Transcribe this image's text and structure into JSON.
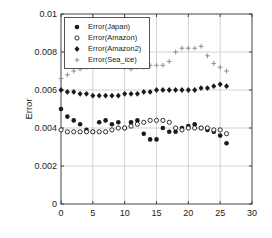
{
  "chart_data": {
    "type": "scatter",
    "title": "",
    "xlabel": "",
    "ylabel": "Error",
    "xlim": [
      0,
      30
    ],
    "ylim": [
      0,
      0.01
    ],
    "grid": true,
    "legend_position": "upper-left",
    "x_ticks": [
      0,
      5,
      10,
      15,
      20,
      25,
      30
    ],
    "x_tick_labels": [
      "0",
      "5",
      "10",
      "15",
      "20",
      "25",
      "30"
    ],
    "y_ticks": [
      0,
      0.002,
      0.004,
      0.006,
      0.008,
      0.01
    ],
    "y_tick_labels": [
      "0",
      "0.002",
      "0.004",
      "0.006",
      "0.008",
      "0.01"
    ],
    "colors": {
      "marker_black": "#1a1a1a",
      "marker_gray": "#8f8f8f",
      "grid": "#d2d2d2",
      "axis": "#444444",
      "text": "#222222"
    },
    "x": [
      0,
      1,
      2,
      3,
      4,
      5,
      6,
      7,
      8,
      9,
      10,
      11,
      12,
      13,
      14,
      15,
      16,
      17,
      18,
      19,
      20,
      21,
      22,
      23,
      24,
      25,
      26
    ],
    "series": [
      {
        "name": "Error(Japan)",
        "marker": "filled-circle",
        "color": "#1a1a1a",
        "values": [
          0.005,
          0.0046,
          0.0044,
          0.0042,
          0.0039,
          0.0038,
          0.0043,
          0.0044,
          0.0042,
          0.0043,
          0.004,
          0.0043,
          0.0044,
          0.0037,
          0.0034,
          0.0034,
          0.004,
          0.0038,
          0.0038,
          0.004,
          0.0041,
          0.0042,
          0.004,
          0.0039,
          0.0038,
          0.0036,
          0.0032
        ]
      },
      {
        "name": "Error(Amazon)",
        "marker": "open-circle",
        "color": "#1a1a1a",
        "values": [
          0.0039,
          0.0038,
          0.0038,
          0.0038,
          0.0038,
          0.0038,
          0.0038,
          0.0038,
          0.0039,
          0.004,
          0.004,
          0.0041,
          0.0042,
          0.0043,
          0.0044,
          0.0044,
          0.0044,
          0.0043,
          0.004,
          0.0039,
          0.004,
          0.004,
          0.004,
          0.004,
          0.0039,
          0.0039,
          0.0037
        ]
      },
      {
        "name": "Error(Amazon2)",
        "marker": "filled-diamond",
        "color": "#1a1a1a",
        "values": [
          0.006,
          0.0059,
          0.0059,
          0.0058,
          0.0058,
          0.0057,
          0.0057,
          0.0057,
          0.0057,
          0.0057,
          0.0058,
          0.0058,
          0.0058,
          0.0059,
          0.0059,
          0.006,
          0.006,
          0.006,
          0.006,
          0.006,
          0.006,
          0.006,
          0.0061,
          0.0061,
          0.0062,
          0.0063,
          0.0062
        ]
      },
      {
        "name": "Error(Sea_ice)",
        "marker": "plus",
        "color": "#8f8f8f",
        "values": [
          0.0066,
          0.0068,
          0.007,
          0.0071,
          0.0072,
          0.0073,
          0.0074,
          0.0074,
          0.0074,
          0.0073,
          0.0072,
          0.0071,
          0.0072,
          0.0072,
          0.0073,
          0.0073,
          0.0073,
          0.0075,
          0.008,
          0.0082,
          0.0082,
          0.0082,
          0.0083,
          0.0078,
          0.0074,
          0.0072,
          0.007
        ]
      }
    ]
  }
}
